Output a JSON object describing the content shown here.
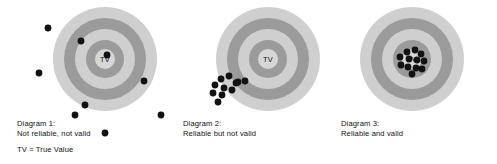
{
  "figure": {
    "background_color": "#ffffff"
  },
  "palette": {
    "ring_light": "#cfcfcf",
    "ring_dark": "#9b9b9b",
    "center_light": "#d6d6d6",
    "dot_color": "#121212",
    "text_color": "#111111"
  },
  "center_label": "TV",
  "legend": {
    "note": "TV = True Value"
  },
  "panels": [
    {
      "id": "diagram-1",
      "caption_title": "Diagram 1:",
      "caption_subtitle": "Not reliable, not valid",
      "center_label": "TV",
      "cx": 105,
      "cy": 59,
      "radii": [
        52,
        41,
        30,
        19
      ],
      "dots": [
        {
          "x": 48,
          "y": 28
        },
        {
          "x": 81,
          "y": 41
        },
        {
          "x": 107,
          "y": 55
        },
        {
          "x": 39,
          "y": 73
        },
        {
          "x": 144,
          "y": 81
        },
        {
          "x": 85,
          "y": 105
        },
        {
          "x": 75,
          "y": 115
        },
        {
          "x": 161,
          "y": 115
        },
        {
          "x": 105,
          "y": 133
        }
      ]
    },
    {
      "id": "diagram-2",
      "caption_title": "Diagram 2:",
      "caption_subtitle": "Reliable but not valid",
      "center_label": "TV",
      "cx": 268,
      "cy": 59,
      "radii": [
        52,
        41,
        30,
        19
      ],
      "dots": [
        {
          "x": 221,
          "y": 79
        },
        {
          "x": 229,
          "y": 76
        },
        {
          "x": 236,
          "y": 83
        },
        {
          "x": 215,
          "y": 85
        },
        {
          "x": 224,
          "y": 88
        },
        {
          "x": 232,
          "y": 90
        },
        {
          "x": 213,
          "y": 93
        },
        {
          "x": 222,
          "y": 95
        },
        {
          "x": 238,
          "y": 82
        },
        {
          "x": 218,
          "y": 102
        },
        {
          "x": 245,
          "y": 81
        }
      ]
    },
    {
      "id": "diagram-3",
      "caption_title": "Diagram 3:",
      "caption_subtitle": "Reliable and valid",
      "center_label": "TV",
      "cx": 412,
      "cy": 59,
      "radii": [
        52,
        41,
        30,
        19
      ],
      "dots": [
        {
          "x": 407,
          "y": 52
        },
        {
          "x": 415,
          "y": 50
        },
        {
          "x": 421,
          "y": 54
        },
        {
          "x": 400,
          "y": 57
        },
        {
          "x": 409,
          "y": 59
        },
        {
          "x": 417,
          "y": 60
        },
        {
          "x": 424,
          "y": 61
        },
        {
          "x": 401,
          "y": 65
        },
        {
          "x": 408,
          "y": 67
        },
        {
          "x": 416,
          "y": 68
        },
        {
          "x": 422,
          "y": 69
        },
        {
          "x": 412,
          "y": 74
        }
      ]
    }
  ]
}
